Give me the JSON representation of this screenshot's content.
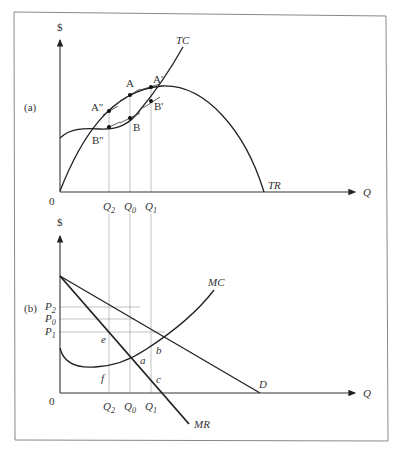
{
  "panel_a": {
    "tag": "(a)",
    "y_axis_label": "$",
    "x_axis_label": "Q",
    "origin_label": "0",
    "curves": {
      "tc": "TC",
      "tr": "TR"
    },
    "points": {
      "A": "A",
      "A1": "A'",
      "A2": "A''",
      "B": "B",
      "B1": "B'",
      "B2": "B''"
    },
    "q_ticks": {
      "q2": "Q",
      "q2_sub": "2",
      "q0": "Q",
      "q0_sub": "0",
      "q1": "Q",
      "q1_sub": "1"
    }
  },
  "panel_b": {
    "tag": "(b)",
    "y_axis_label": "$",
    "x_axis_label": "Q",
    "origin_label": "0",
    "curves": {
      "mc": "MC",
      "mr": "MR",
      "d": "D"
    },
    "prices": {
      "p2": "P",
      "p2_sub": "2",
      "p0": "P",
      "p0_sub": "0",
      "p1": "P",
      "p1_sub": "1"
    },
    "points": {
      "a": "a",
      "b": "b",
      "c": "c",
      "e": "e",
      "f": "f"
    },
    "q_ticks": {
      "q2": "Q",
      "q2_sub": "2",
      "q0": "Q",
      "q0_sub": "0",
      "q1": "Q",
      "q1_sub": "1"
    }
  }
}
